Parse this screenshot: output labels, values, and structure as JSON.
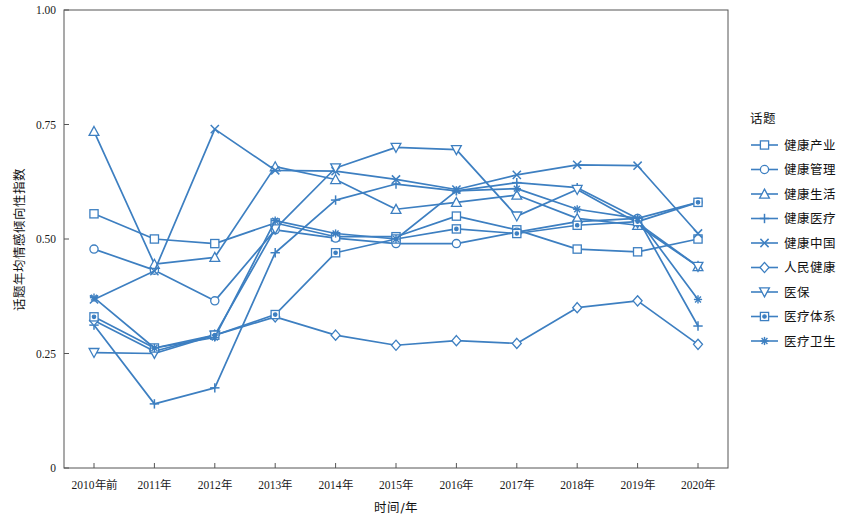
{
  "chart_data": {
    "type": "line",
    "title": "",
    "xlabel": "时间/年",
    "ylabel": "话题年均情感倾向性指数",
    "legend_title": "话题",
    "legend_position": "right",
    "grid": false,
    "accent_color": "#3d7fc1",
    "axis_color": "#555555",
    "ylim": [
      0,
      1.0
    ],
    "yticks": [
      0,
      0.25,
      0.5,
      0.75,
      1.0
    ],
    "ytick_labels": [
      "0",
      "0.25",
      "0.50",
      "0.75",
      "1.00"
    ],
    "categories": [
      "2010年前",
      "2011年",
      "2012年",
      "2013年",
      "2014年",
      "2015年",
      "2016年",
      "2017年",
      "2018年",
      "2019年",
      "2020年"
    ],
    "series": [
      {
        "name": "健康产业",
        "marker": "square",
        "values": [
          0.555,
          0.5,
          0.49,
          0.535,
          0.505,
          0.505,
          0.55,
          0.52,
          0.478,
          0.472,
          0.5
        ]
      },
      {
        "name": "健康管理",
        "marker": "circle",
        "values": [
          0.478,
          0.432,
          0.365,
          0.52,
          0.502,
          0.49,
          0.49,
          0.515,
          0.538,
          0.545,
          0.58
        ]
      },
      {
        "name": "健康生活",
        "marker": "triangle-up",
        "values": [
          0.735,
          0.445,
          0.46,
          0.658,
          0.63,
          0.565,
          0.58,
          0.596,
          0.545,
          0.53,
          0.44
        ]
      },
      {
        "name": "健康医疗",
        "marker": "plus",
        "values": [
          0.312,
          0.14,
          0.175,
          0.47,
          0.585,
          0.62,
          0.605,
          0.623,
          0.612,
          0.545,
          0.31
        ]
      },
      {
        "name": "健康中国",
        "marker": "cross-x",
        "values": [
          0.368,
          0.43,
          0.74,
          0.65,
          0.648,
          0.63,
          0.608,
          0.64,
          0.662,
          0.66,
          0.512
        ]
      },
      {
        "name": "人民健康",
        "marker": "diamond",
        "values": [
          0.322,
          0.255,
          0.29,
          0.33,
          0.29,
          0.268,
          0.278,
          0.272,
          0.35,
          0.365,
          0.27
        ]
      },
      {
        "name": "医保",
        "marker": "triangle-down",
        "values": [
          0.252,
          0.25,
          0.29,
          0.522,
          0.655,
          0.7,
          0.695,
          0.55,
          0.608,
          0.535,
          0.44
        ]
      },
      {
        "name": "医疗体系",
        "marker": "square-dot",
        "values": [
          0.33,
          0.262,
          0.29,
          0.335,
          0.47,
          0.5,
          0.522,
          0.512,
          0.53,
          0.538,
          0.58
        ]
      },
      {
        "name": "医疗卫生",
        "marker": "asterisk",
        "values": [
          0.372,
          0.262,
          0.285,
          0.54,
          0.512,
          0.5,
          0.605,
          0.61,
          0.565,
          0.545,
          0.368
        ]
      }
    ]
  },
  "axes": {
    "x_label": "时间/年",
    "y_label": "话题年均情感倾向性指数"
  },
  "legend": {
    "title": "话题",
    "items": [
      {
        "label": "健康产业"
      },
      {
        "label": "健康管理"
      },
      {
        "label": "健康生活"
      },
      {
        "label": "健康医疗"
      },
      {
        "label": "健康中国"
      },
      {
        "label": "人民健康"
      },
      {
        "label": "医保"
      },
      {
        "label": "医疗体系"
      },
      {
        "label": "医疗卫生"
      }
    ]
  }
}
